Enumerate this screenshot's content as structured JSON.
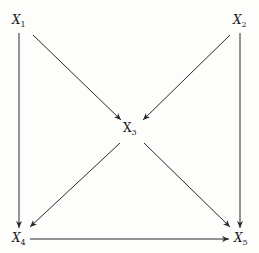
{
  "diagram": {
    "type": "directed-graph",
    "stroke_color": "#2a2a2a",
    "nodes": [
      {
        "id": "X1",
        "base": "X",
        "sub": "1",
        "x": 12,
        "y": 14
      },
      {
        "id": "X2",
        "base": "X",
        "sub": "2",
        "x": 233,
        "y": 14
      },
      {
        "id": "X3",
        "base": "X",
        "sub": "3",
        "x": 123,
        "y": 122
      },
      {
        "id": "X4",
        "base": "X",
        "sub": "4",
        "x": 12,
        "y": 232
      },
      {
        "id": "X5",
        "base": "X",
        "sub": "5",
        "x": 234,
        "y": 232
      }
    ],
    "edges": [
      {
        "from": "X1",
        "to": "X4"
      },
      {
        "from": "X1",
        "to": "X3"
      },
      {
        "from": "X2",
        "to": "X3"
      },
      {
        "from": "X2",
        "to": "X5"
      },
      {
        "from": "X3",
        "to": "X4"
      },
      {
        "from": "X3",
        "to": "X5"
      },
      {
        "from": "X4",
        "to": "X5"
      }
    ]
  }
}
